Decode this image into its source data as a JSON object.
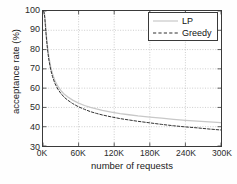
{
  "chart_data": {
    "type": "line",
    "title": "",
    "xlabel": "number of requests",
    "ylabel": "acceptance rate (%)",
    "xlim": [
      0,
      300000
    ],
    "ylim": [
      30,
      100
    ],
    "grid": true,
    "legend_position": "top-right",
    "xticks": [
      {
        "value": 0,
        "label": "0K"
      },
      {
        "value": 60000,
        "label": "60K"
      },
      {
        "value": 120000,
        "label": "120K"
      },
      {
        "value": 180000,
        "label": "180K"
      },
      {
        "value": 240000,
        "label": "240K"
      },
      {
        "value": 300000,
        "label": "300K"
      }
    ],
    "yticks": [
      {
        "value": 100,
        "label": "100"
      },
      {
        "value": 90,
        "label": "90"
      },
      {
        "value": 80,
        "label": "80"
      },
      {
        "value": 70,
        "label": "70"
      },
      {
        "value": 60,
        "label": "60"
      },
      {
        "value": 50,
        "label": "50"
      },
      {
        "value": 40,
        "label": "40"
      },
      {
        "value": 30,
        "label": "30"
      }
    ],
    "x": [
      1000,
      2000,
      3000,
      4000,
      5000,
      6000,
      8000,
      10000,
      13000,
      16000,
      20000,
      25000,
      30000,
      36000,
      42000,
      50000,
      60000,
      70000,
      80000,
      90000,
      100000,
      115000,
      130000,
      145000,
      160000,
      180000,
      200000,
      220000,
      240000,
      260000,
      280000,
      300000
    ],
    "series": [
      {
        "name": "LP",
        "color": "#c8c8c8",
        "style": "solid",
        "values": [
          100.0,
          99.5,
          97.5,
          94.0,
          90.0,
          86.5,
          80.5,
          76.0,
          71.0,
          67.5,
          64.0,
          61.0,
          58.8,
          56.8,
          55.4,
          53.8,
          52.2,
          51.0,
          50.0,
          49.2,
          48.5,
          47.6,
          46.8,
          46.2,
          45.6,
          45.0,
          44.4,
          43.8,
          43.3,
          42.9,
          42.5,
          42.1
        ]
      },
      {
        "name": "Greedy",
        "color": "#303030",
        "style": "dashed",
        "values": [
          100.0,
          99.0,
          96.5,
          92.5,
          88.5,
          85.0,
          79.0,
          74.5,
          69.5,
          66.0,
          62.5,
          59.5,
          57.3,
          55.2,
          53.7,
          52.0,
          50.3,
          49.0,
          47.8,
          46.9,
          46.1,
          45.1,
          44.2,
          43.5,
          42.8,
          42.0,
          41.2,
          40.5,
          39.9,
          39.4,
          38.8,
          38.3
        ]
      }
    ]
  },
  "legend": {
    "entries": [
      {
        "label": "LP"
      },
      {
        "label": "Greedy"
      }
    ]
  }
}
